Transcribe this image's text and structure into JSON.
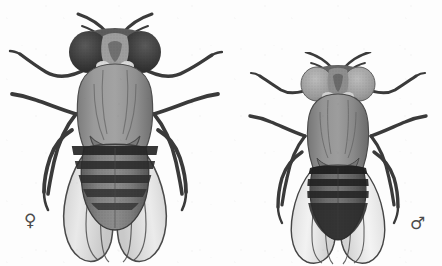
{
  "figure": {
    "caption_note": "Sexual dimorphism: female (left) larger with banded abdomen; male (right) smaller with dark abdominal tip",
    "background_color": "#fdfdfd",
    "specimen_count": 2
  },
  "specimens": [
    {
      "id": "female",
      "sex_symbol": "♀",
      "sex_label": "female",
      "position_label": "left",
      "relative_size": "larger",
      "body_length_px": 190,
      "body_color": "#8e8e8e",
      "eye_color": "#3c3c3c",
      "abdomen_color": "#6e6e6e",
      "abdomen_band_count": 5,
      "abdomen_band_color": "#2f2f2f",
      "abdomen_tip": "pointed, banded to apex",
      "wing_color": "#c9c9c9",
      "wing_vein_color": "#4a4a4a",
      "leg_color": "#3a3a3a",
      "leg_count": 6,
      "antenna_count": 2
    },
    {
      "id": "male",
      "sex_symbol": "♂",
      "sex_label": "male",
      "position_label": "right",
      "relative_size": "smaller",
      "body_length_px": 150,
      "body_color": "#8a8a8a",
      "eye_color": "#9a9a9a",
      "abdomen_color": "#5e5e5e",
      "abdomen_band_count": 4,
      "abdomen_band_color": "#2a2a2a",
      "abdomen_tip": "rounded, solid dark",
      "wing_color": "#d6d6d6",
      "wing_vein_color": "#454545",
      "leg_color": "#3a3a3a",
      "leg_count": 6,
      "antenna_count": 2
    }
  ],
  "palette": {
    "ink_dark": "#2f2f2f",
    "ink_mid": "#6e6e6e",
    "ink_light": "#c9c9c9",
    "paper": "#fdfdfd",
    "symbol": "#4b4b4b"
  }
}
